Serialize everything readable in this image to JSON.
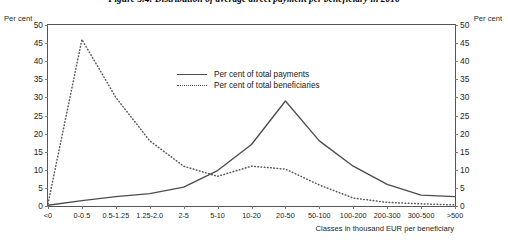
{
  "figure": {
    "title": "Figure 3.4: Distribution of average direct payment per beneficiary in 2016",
    "unit_left": "Per cent",
    "unit_right": "Per cent",
    "xaxis_caption": "Classes in thousand EUR per beneficiary"
  },
  "legend": {
    "items": [
      {
        "label": "Per cent of total payments",
        "style": "solid",
        "color": "#4d4d4d"
      },
      {
        "label": "Per cent of total beneficiaries",
        "style": "dotted",
        "color": "#4d4d4d"
      }
    ]
  },
  "colors": {
    "payments_line": "#4d4d4d",
    "beneficiaries_line": "#595959",
    "axis": "#555555",
    "text": "#1a1a1a"
  },
  "chart_data": {
    "type": "line",
    "title": "Figure 3.4: Distribution of average direct payment per beneficiary in 2016",
    "xlabel": "Classes in thousand EUR per beneficiary",
    "ylabel": "Per cent",
    "ylabel_right": "Per cent",
    "ylim": [
      0,
      50
    ],
    "yticks": [
      0,
      5,
      10,
      15,
      20,
      25,
      30,
      35,
      40,
      45,
      50
    ],
    "grid": false,
    "legend_position": "inside-top-center",
    "categories": [
      "<0",
      "0-0.5",
      "0.5-1.25",
      "1.25-2.0",
      "2-5",
      "5-10",
      "10-20",
      "20-50",
      "50-100",
      "100-200",
      "200-300",
      "300-500",
      ">500"
    ],
    "series": [
      {
        "name": "Per cent of total payments",
        "style": "solid",
        "values": [
          0.2,
          1.5,
          2.6,
          3.4,
          5.2,
          9.8,
          17.0,
          29.0,
          18.0,
          11.0,
          6.0,
          3.0,
          2.6
        ]
      },
      {
        "name": "Per cent of total beneficiaries",
        "style": "dotted",
        "values": [
          0.6,
          46.0,
          30.0,
          18.0,
          11.0,
          8.2,
          11.0,
          10.2,
          5.8,
          2.2,
          1.0,
          0.6,
          0.3
        ]
      }
    ]
  }
}
